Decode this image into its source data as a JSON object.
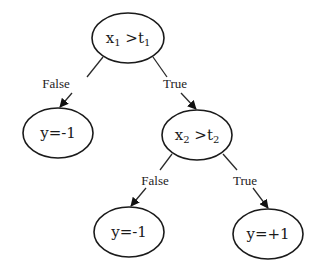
{
  "diagram": {
    "type": "decision-tree",
    "nodes": {
      "root": {
        "var": "x",
        "var_sub": "1",
        "op": " >",
        "thr": "t",
        "thr_sub": "1"
      },
      "leaf_left": {
        "label": "y=-1"
      },
      "inner": {
        "var": "x",
        "var_sub": "2",
        "op": " >",
        "thr": "t",
        "thr_sub": "2"
      },
      "leaf_bottom_left": {
        "label": "y=-1"
      },
      "leaf_bottom_right": {
        "label": "y=+1"
      }
    },
    "edges": {
      "root_false": {
        "label": "False"
      },
      "root_true": {
        "label": "True"
      },
      "inner_false": {
        "label": "False"
      },
      "inner_true": {
        "label": "True"
      }
    }
  }
}
